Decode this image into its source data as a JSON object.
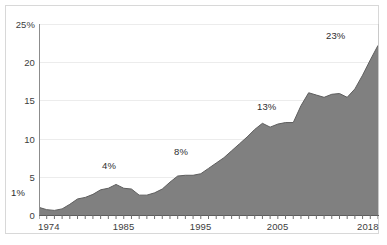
{
  "chart_data": {
    "type": "area",
    "title": "",
    "xlabel": "",
    "ylabel": "",
    "xlim": [
      1974,
      2018
    ],
    "ylim": [
      0,
      25
    ],
    "grid": true,
    "legend": "none",
    "fill_color": "#808080",
    "line_color": "#5e5e5e",
    "gridline_color": "#ececec",
    "y_ticks": [
      {
        "value": 25,
        "label": "25%"
      },
      {
        "value": 20,
        "label": "20"
      },
      {
        "value": 15,
        "label": "15"
      },
      {
        "value": 10,
        "label": "10"
      },
      {
        "value": 5,
        "label": "5"
      },
      {
        "value": 0,
        "label": "0"
      }
    ],
    "x_ticks": [
      {
        "value": 1974,
        "label": "1974"
      },
      {
        "value": 1985,
        "label": "1985"
      },
      {
        "value": 1995,
        "label": "1995"
      },
      {
        "value": 2005,
        "label": "2005"
      },
      {
        "value": 2018,
        "label": "2018"
      }
    ],
    "x": [
      1974,
      1975,
      1976,
      1977,
      1978,
      1979,
      1980,
      1981,
      1982,
      1983,
      1984,
      1985,
      1986,
      1987,
      1988,
      1989,
      1990,
      1991,
      1992,
      1993,
      1994,
      1995,
      1996,
      1997,
      1998,
      1999,
      2000,
      2001,
      2002,
      2003,
      2004,
      2005,
      2006,
      2007,
      2008,
      2009,
      2010,
      2011,
      2012,
      2013,
      2014,
      2015,
      2016,
      2017,
      2018
    ],
    "values": [
      1.0,
      0.7,
      0.6,
      0.8,
      1.4,
      2.1,
      2.3,
      2.7,
      3.3,
      3.5,
      4.0,
      3.5,
      3.4,
      2.6,
      2.6,
      2.9,
      3.4,
      4.3,
      5.1,
      5.2,
      5.2,
      5.4,
      6.1,
      6.8,
      7.5,
      8.4,
      9.3,
      10.2,
      11.2,
      12.0,
      11.5,
      11.9,
      12.1,
      12.1,
      14.3,
      16.0,
      15.7,
      15.4,
      15.8,
      15.9,
      15.4,
      16.5,
      18.3,
      20.3,
      22.2
    ],
    "annotations": [
      {
        "label": "1%",
        "x": 1974,
        "value": 1.0
      },
      {
        "label": "4%",
        "x": 1984,
        "value": 4.0
      },
      {
        "label": "8%",
        "x": 1995,
        "value": 8.0
      },
      {
        "label": "13%",
        "x": 2004,
        "value": 13.0
      },
      {
        "label": "23%",
        "x": 2018,
        "value": 23.0
      }
    ],
    "annotation_positions": [
      {
        "name": "annotation-1-percent",
        "left": 5,
        "top": 181
      },
      {
        "name": "annotation-4-percent",
        "left": 96,
        "top": 154
      },
      {
        "name": "annotation-8-percent",
        "left": 168,
        "top": 140
      },
      {
        "name": "annotation-13-percent",
        "left": 251,
        "top": 95
      },
      {
        "name": "annotation-23-percent",
        "left": 320,
        "top": 24
      }
    ]
  }
}
